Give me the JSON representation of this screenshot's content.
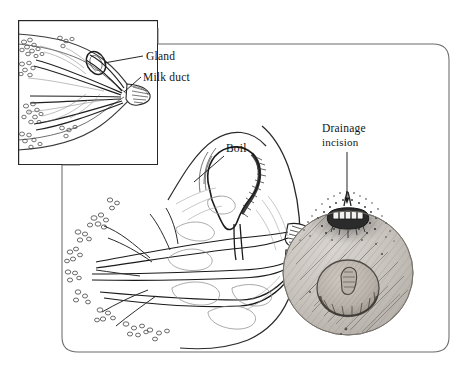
{
  "figure": {
    "kind": "anatomical-line-illustration",
    "background_color": "#ffffff",
    "ink_color": "#1a1a1a",
    "line_color": "#555555"
  },
  "frame": {
    "outer": {
      "name": "outer-rounded-frame",
      "x": 62,
      "y": 44,
      "width": 387,
      "height": 309,
      "corner_radius": 16,
      "stroke": "#6b6b6b",
      "stroke_width": 1
    },
    "inset": {
      "name": "inset-detail-box",
      "x": 18,
      "y": 20,
      "width": 140,
      "height": 145,
      "stroke": "#262626",
      "stroke_width": 1.2
    }
  },
  "labels": [
    {
      "id": "gland",
      "text": "Gland",
      "x": 146,
      "y": 60,
      "leader": {
        "from_x": 143,
        "from_y": 56,
        "to_x": 98,
        "to_y": 63
      }
    },
    {
      "id": "milk-duct",
      "text": "Milk duct",
      "x": 143,
      "y": 81,
      "leader": {
        "from_x": 140,
        "from_y": 78,
        "to_x": 124,
        "to_y": 91
      }
    },
    {
      "id": "boil",
      "text": "Boil",
      "x": 226,
      "y": 152,
      "leader": {
        "from_x": 224,
        "from_y": 155,
        "to_x": 196,
        "to_y": 180
      }
    },
    {
      "id": "drainage-incision",
      "text_line_1": "Drainage",
      "text_line_2": "incision",
      "x": 322,
      "y": 132,
      "leader": {
        "from_x": 347,
        "from_y": 152,
        "to_x": 347,
        "to_y": 204
      }
    }
  ],
  "views": [
    {
      "id": "inset-cross-section",
      "title": "magnified nipple cross-section",
      "features": [
        "gland",
        "milk duct",
        "lobules",
        "nipple"
      ]
    },
    {
      "id": "main-cross-section",
      "title": "breast cross-section with abscess",
      "features": [
        "boil cavity",
        "converging milk ducts",
        "lobular tree",
        "nipple"
      ]
    },
    {
      "id": "frontal-view",
      "title": "frontal breast view after drainage",
      "features": [
        "areola",
        "nipple",
        "drainage incision",
        "sutures"
      ]
    }
  ]
}
